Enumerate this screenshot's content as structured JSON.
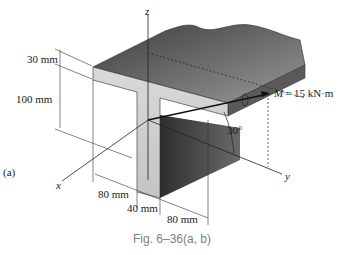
{
  "figure": {
    "caption": "Fig. 6–36(a, b)",
    "part_label": "(a)",
    "axes": {
      "z": "z",
      "x": "x",
      "y": "y"
    },
    "moment": {
      "symbol": "M",
      "value_text": "= 15 kN·m"
    },
    "angle": "30°",
    "dimensions": {
      "flange_thickness": "30 mm",
      "web_height": "100 mm",
      "left_overhang": "80 mm",
      "web_width": "40 mm",
      "right_overhang": "80 mm"
    },
    "colors": {
      "background": "#ffffff",
      "beam_top_dark": "#4a4a4a",
      "beam_top_light": "#8a8a8a",
      "cross_section_face": "#d4d4d4",
      "web_side_dark": "#3a3a3a",
      "line": "#1a1a1a",
      "caption_text": "#7a7f86"
    }
  }
}
